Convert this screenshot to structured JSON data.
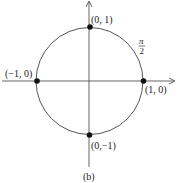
{
  "diagram": {
    "type": "unit-circle",
    "caption": "(b)",
    "angle_label": {
      "numerator": "π",
      "denominator": "2"
    },
    "points": [
      {
        "id": "top",
        "label": "(0, 1)"
      },
      {
        "id": "right",
        "label": "(1, 0)"
      },
      {
        "id": "bottom",
        "label": "(0,−1)"
      },
      {
        "id": "left",
        "label": "(−1, 0)"
      }
    ],
    "colors": {
      "stroke": "#333333",
      "point": "#111111"
    }
  }
}
